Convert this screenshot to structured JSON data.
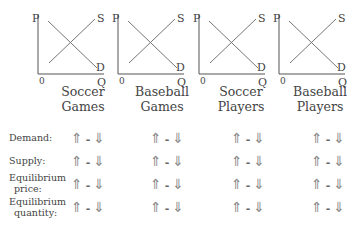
{
  "graphs": [
    {
      "title_line1": "Soccer",
      "title_line2": "Games",
      "p_label": "P",
      "q_label": "Q",
      "origin_label": "0",
      "supply_label": "S",
      "demand_label": "D"
    },
    {
      "title_line1": "Baseball",
      "title_line2": "Games",
      "p_label": "P",
      "q_label": "Q",
      "origin_label": "0",
      "supply_label": "S",
      "demand_label": "D"
    },
    {
      "title_line1": "Soccer",
      "title_line2": "Players",
      "p_label": "P",
      "q_label": "Q",
      "origin_label": "0",
      "supply_label": "S",
      "demand_label": "D"
    },
    {
      "title_line1": "Baseball",
      "title_line2": "Players",
      "p_label": "P",
      "q_label": "Q",
      "origin_label": "0",
      "supply_label": "S",
      "demand_label": "D"
    }
  ],
  "rows": [
    {
      "label_line1": "Demand:",
      "label_line2": ""
    },
    {
      "label_line1": "Supply:",
      "label_line2": ""
    },
    {
      "label_line1": "Equilibrium",
      "label_line2": "price:"
    },
    {
      "label_line1": "Equilibrium",
      "label_line2": "quantity:"
    }
  ],
  "choice": {
    "up": "⇑",
    "sep": "-",
    "down": "⇓"
  },
  "colors": {
    "axis": "#555555",
    "curve": "#666666",
    "text": "#444444"
  }
}
